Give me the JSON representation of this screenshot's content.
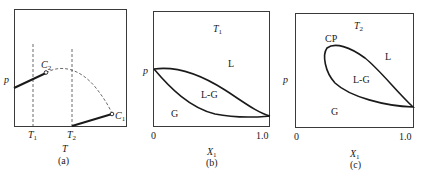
{
  "panels": [
    {
      "id": "a",
      "caption": "(a)",
      "y_axis_label": "p",
      "x_axis_label": "T",
      "x_ticks": [
        "T1",
        "T2"
      ],
      "points": [
        "C2",
        "C1"
      ],
      "description": "p–T projection: vapor-pressure lines of two pure components ending at critical points C2 and C1, joined by a dashed critical locus; dashed verticals at T1 and T2"
    },
    {
      "id": "b",
      "caption": "(b)",
      "title": "T1",
      "y_axis_label": "p",
      "x_axis_label": "X1",
      "x_ticks": [
        "0",
        "1.0"
      ],
      "regions": [
        "L",
        "L-G",
        "G"
      ]
    },
    {
      "id": "c",
      "caption": "(c)",
      "title": "T2",
      "y_axis_label": "p",
      "x_axis_label": "X1",
      "x_ticks": [
        "0",
        "1.0"
      ],
      "regions": [
        "CP",
        "L",
        "L-G",
        "G"
      ]
    }
  ],
  "labels": {
    "a_p": "p",
    "a_T": "T",
    "a_T1": "T",
    "a_T1_sub": "1",
    "a_T2": "T",
    "a_T2_sub": "2",
    "a_C2": "C",
    "a_C2_sub": "2",
    "a_C1": "C",
    "a_C1_sub": "1",
    "a_caption": "(a)",
    "b_title": "T",
    "b_title_sub": "1",
    "b_p": "p",
    "b_L": "L",
    "b_LG": "L-G",
    "b_G": "G",
    "b_x0": "0",
    "b_x1": "1.0",
    "b_xlabel": "X",
    "b_xlabel_sub": "1",
    "b_caption": "(b)",
    "c_title": "T",
    "c_title_sub": "2",
    "c_p": "p",
    "c_CP": "CP",
    "c_L": "L",
    "c_LG": "L-G",
    "c_G": "G",
    "c_x0": "0",
    "c_x1": "1.0",
    "c_xlabel": "X",
    "c_xlabel_sub": "1",
    "c_caption": "(c)"
  }
}
